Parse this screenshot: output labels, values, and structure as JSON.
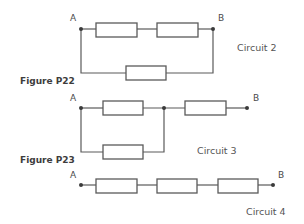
{
  "figures": [
    {
      "label": "Figure P22",
      "x": 20,
      "y": 77
    },
    {
      "label": "Figure P23",
      "x": 20,
      "y": 156
    }
  ],
  "circuits": [
    {
      "name": "Circuit 2",
      "name_pos": {
        "x": 237,
        "y": 43
      },
      "terminals": [
        {
          "label": "A",
          "dot": [
            81,
            29
          ],
          "label_pos": [
            70,
            14
          ]
        },
        {
          "label": "B",
          "dot": [
            213,
            29
          ],
          "label_pos": [
            218,
            14
          ]
        }
      ],
      "resistors": [
        {
          "x": 96,
          "y": 23,
          "w": 41,
          "h": 14
        },
        {
          "x": 157,
          "y": 23,
          "w": 41,
          "h": 14
        },
        {
          "x": 126,
          "y": 66,
          "w": 40,
          "h": 14
        }
      ],
      "junctions": [],
      "wires": [
        [
          [
            81,
            29
          ],
          [
            96,
            29
          ]
        ],
        [
          [
            137,
            29
          ],
          [
            157,
            29
          ]
        ],
        [
          [
            198,
            29
          ],
          [
            213,
            29
          ]
        ],
        [
          [
            81,
            29
          ],
          [
            81,
            73
          ],
          [
            126,
            73
          ]
        ],
        [
          [
            166,
            73
          ],
          [
            213,
            73
          ],
          [
            213,
            29
          ]
        ]
      ]
    },
    {
      "name": "Circuit 3",
      "name_pos": {
        "x": 197,
        "y": 146
      },
      "terminals": [
        {
          "label": "A",
          "dot": [
            81,
            108
          ],
          "label_pos": [
            70,
            94
          ]
        },
        {
          "label": "B",
          "dot": [
            247,
            108
          ],
          "label_pos": [
            253,
            94
          ]
        }
      ],
      "resistors": [
        {
          "x": 103,
          "y": 101,
          "w": 40,
          "h": 14
        },
        {
          "x": 185,
          "y": 101,
          "w": 41,
          "h": 14
        },
        {
          "x": 103,
          "y": 145,
          "w": 40,
          "h": 14
        }
      ],
      "junctions": [
        [
          164,
          108
        ]
      ],
      "wires": [
        [
          [
            81,
            108
          ],
          [
            103,
            108
          ]
        ],
        [
          [
            143,
            108
          ],
          [
            185,
            108
          ]
        ],
        [
          [
            226,
            108
          ],
          [
            247,
            108
          ]
        ],
        [
          [
            81,
            108
          ],
          [
            81,
            152
          ],
          [
            103,
            152
          ]
        ],
        [
          [
            143,
            152
          ],
          [
            164,
            152
          ],
          [
            164,
            108
          ]
        ]
      ]
    },
    {
      "name": "Circuit 4",
      "name_pos": {
        "x": 246,
        "y": 207
      },
      "terminals": [
        {
          "label": "A",
          "dot": [
            81,
            185
          ],
          "label_pos": [
            70,
            171
          ]
        },
        {
          "label": "B",
          "dot": [
            273,
            185
          ],
          "label_pos": [
            278,
            171
          ]
        }
      ],
      "resistors": [
        {
          "x": 96,
          "y": 179,
          "w": 41,
          "h": 14
        },
        {
          "x": 157,
          "y": 179,
          "w": 40,
          "h": 14
        },
        {
          "x": 218,
          "y": 179,
          "w": 40,
          "h": 14
        }
      ],
      "junctions": [],
      "wires": [
        [
          [
            81,
            185
          ],
          [
            96,
            185
          ]
        ],
        [
          [
            137,
            185
          ],
          [
            157,
            185
          ]
        ],
        [
          [
            197,
            185
          ],
          [
            218,
            185
          ]
        ],
        [
          [
            258,
            185
          ],
          [
            273,
            185
          ]
        ]
      ]
    }
  ]
}
